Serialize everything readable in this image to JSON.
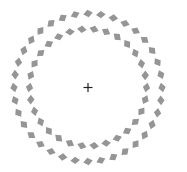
{
  "figure": {
    "width": 187,
    "height": 172,
    "background": "#ffffff",
    "center": {
      "x": 88,
      "y": 87.5
    },
    "fixation_cross": {
      "size": 9,
      "stroke": 1.2,
      "color": "#222222"
    },
    "element_color": "#959595",
    "rings": [
      {
        "name": "outer-ring",
        "radius": 74,
        "count": 36,
        "size": 6,
        "tilt_deg": 25,
        "skew_deg": -15
      },
      {
        "name": "inner-ring",
        "radius": 58.5,
        "count": 30,
        "size": 6,
        "tilt_deg": -25,
        "skew_deg": 15
      }
    ]
  }
}
